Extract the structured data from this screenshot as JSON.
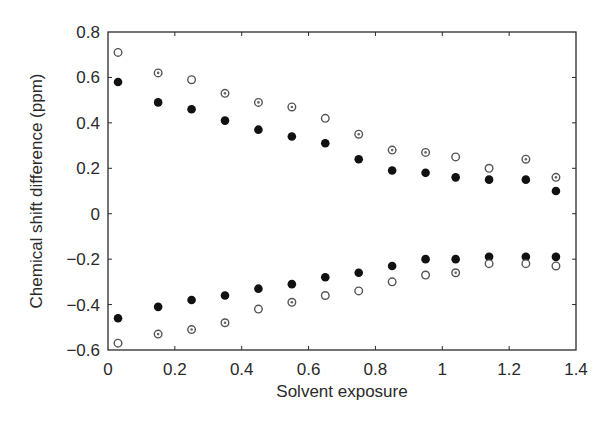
{
  "chart_data": {
    "type": "scatter",
    "title": "",
    "xlabel": "Solvent exposure",
    "ylabel": "Chemical shift difference (ppm)",
    "xlim": [
      0,
      1.4
    ],
    "ylim": [
      -0.6,
      0.8
    ],
    "xticks": [
      0,
      0.2,
      0.4,
      0.6,
      0.8,
      1,
      1.2,
      1.4
    ],
    "xtick_labels": [
      "0",
      "0.2",
      "0.4",
      "0.6",
      "0.8",
      "1",
      "1.2",
      "1.4"
    ],
    "yticks": [
      -0.6,
      -0.4,
      -0.2,
      0,
      0.2,
      0.4,
      0.6,
      0.8
    ],
    "ytick_labels": [
      "−0.6",
      "−0.4",
      "−0.2",
      "0",
      "0.2",
      "0.4",
      "0.6",
      "0.8"
    ],
    "grid": false,
    "legend": "none",
    "x": [
      0.03,
      0.15,
      0.25,
      0.35,
      0.45,
      0.55,
      0.65,
      0.75,
      0.85,
      0.95,
      1.04,
      1.14,
      1.25,
      1.34
    ],
    "series": [
      {
        "name": "upper-filled",
        "marker": "filled-circle",
        "values": [
          0.58,
          0.49,
          0.46,
          0.41,
          0.37,
          0.34,
          0.31,
          0.24,
          0.19,
          0.18,
          0.16,
          0.15,
          0.15,
          0.1
        ]
      },
      {
        "name": "upper-open",
        "marker": "open-circle",
        "values": [
          0.71,
          0.62,
          0.59,
          0.53,
          0.49,
          0.47,
          0.42,
          0.35,
          0.28,
          0.27,
          0.25,
          0.2,
          0.24,
          0.16
        ],
        "dotted": [
          false,
          true,
          false,
          true,
          true,
          true,
          false,
          true,
          true,
          true,
          false,
          false,
          true,
          true
        ]
      },
      {
        "name": "lower-filled",
        "marker": "filled-circle",
        "values": [
          -0.46,
          -0.41,
          -0.38,
          -0.36,
          -0.33,
          -0.31,
          -0.28,
          -0.26,
          -0.23,
          -0.2,
          -0.2,
          -0.19,
          -0.19,
          -0.19
        ]
      },
      {
        "name": "lower-open",
        "marker": "open-circle",
        "values": [
          -0.57,
          -0.53,
          -0.51,
          -0.48,
          -0.42,
          -0.39,
          -0.36,
          -0.34,
          -0.3,
          -0.27,
          -0.26,
          -0.22,
          -0.22,
          -0.23
        ],
        "dotted": [
          false,
          true,
          true,
          true,
          false,
          true,
          false,
          false,
          false,
          false,
          true,
          false,
          false,
          false
        ]
      }
    ]
  },
  "colors": {
    "axis": "#2a2a2a",
    "filled_marker": "#111111",
    "open_marker_stroke": "#555555",
    "open_marker_dot": "#666666",
    "background": "#ffffff"
  }
}
